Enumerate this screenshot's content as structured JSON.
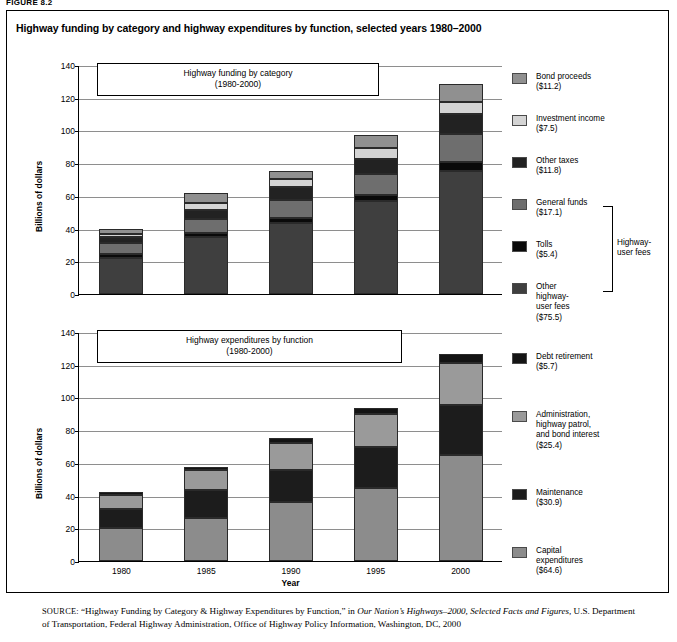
{
  "figure_label": "FIGURE 8.2",
  "title": "Highway funding by category and highway expenditures by function, selected years 1980–2000",
  "source": {
    "prefix": "SOURCE:",
    "quoted": "“Highway Funding by Category & Highway Expenditures by Function,” in ",
    "italic1": "Our Nation’s Highways–2000, Selected Facts and Figures,",
    "rest": " U.S. Department of Transportation, Federal Highway Administration, Office of Highway Policy Information, Washington, DC, 2000"
  },
  "chart_data": [
    {
      "type": "bar",
      "stacked": true,
      "title": "Highway funding by category",
      "subtitle": "(1980-2000)",
      "xlabel": "",
      "ylabel": "Billions of dollars",
      "ylim": [
        0,
        140
      ],
      "yticks": [
        0,
        20,
        40,
        60,
        80,
        100,
        120,
        140
      ],
      "grid": true,
      "legend_position": "right",
      "categories": [
        "1980",
        "1985",
        "1990",
        "1995",
        "2000"
      ],
      "xtick_labels_visible": false,
      "series": [
        {
          "name": "Other highway-user fees",
          "label": "Other\nhighway-\nuser fees\n($75.5)",
          "color": "#3f3f3f",
          "values": [
            22.3,
            34.6,
            43.5,
            56.6,
            75.5
          ]
        },
        {
          "name": "Tolls",
          "label": "Tolls\n($5.4)",
          "color": "#0a0a0a",
          "values": [
            2.0,
            2.6,
            3.2,
            4.1,
            5.4
          ]
        },
        {
          "name": "General funds",
          "label": "General funds\n($17.1)",
          "color": "#6e6e6e",
          "values": [
            6.6,
            8.9,
            11.0,
            12.5,
            17.1
          ]
        },
        {
          "name": "Other taxes",
          "label": "Other taxes\n($11.8)",
          "color": "#222222",
          "values": [
            4.0,
            5.3,
            7.6,
            9.4,
            11.8
          ]
        },
        {
          "name": "Investment income",
          "label": "Investment income\n($7.5)",
          "color": "#d4d4d4",
          "values": [
            1.6,
            4.1,
            5.2,
            6.4,
            7.5
          ]
        },
        {
          "name": "Bond proceeds",
          "label": "Bond proceeds\n($11.2)",
          "color": "#909090",
          "values": [
            3.2,
            6.0,
            5.0,
            8.0,
            11.2
          ]
        }
      ],
      "totals": [
        39.7,
        61.5,
        75.5,
        97.0,
        128.5
      ],
      "group_bracket_label": "Highway-\nuser fees",
      "group_bracket_members": [
        "Tolls",
        "Other highway-user fees"
      ]
    },
    {
      "type": "bar",
      "stacked": true,
      "title": "Highway expenditures by function",
      "subtitle": "(1980-2000)",
      "xlabel": "Year",
      "ylabel": "Billions of dollars",
      "ylim": [
        0,
        140
      ],
      "yticks": [
        0,
        20,
        40,
        60,
        80,
        100,
        120,
        140
      ],
      "grid": true,
      "legend_position": "right",
      "categories": [
        "1980",
        "1985",
        "1990",
        "1995",
        "2000"
      ],
      "xtick_labels_visible": true,
      "series": [
        {
          "name": "Capital expenditures",
          "label": "Capital\nexpenditures\n($64.6)",
          "color": "#8c8c8c",
          "values": [
            20.3,
            26.5,
            36.0,
            44.6,
            64.6
          ]
        },
        {
          "name": "Maintenance",
          "label": "Maintenance\n($30.9)",
          "color": "#1c1c1c",
          "values": [
            11.8,
            17.0,
            19.8,
            25.0,
            30.9
          ]
        },
        {
          "name": "Administration, highway patrol, and bond interest",
          "label": "Administration,\nhighway patrol,\nand bond interest\n($25.4)",
          "color": "#9a9a9a",
          "values": [
            8.5,
            12.2,
            16.4,
            20.3,
            25.4
          ]
        },
        {
          "name": "Debt retirement",
          "label": "Debt retirement\n($5.7)",
          "color": "#141414",
          "values": [
            1.4,
            1.8,
            3.0,
            3.6,
            5.7
          ]
        }
      ],
      "totals": [
        42.0,
        57.5,
        75.2,
        93.5,
        126.6
      ]
    }
  ],
  "axes": {
    "ytick_labels": [
      "0",
      "20",
      "40",
      "60",
      "80",
      "100",
      "120",
      "140"
    ],
    "xtick_labels": [
      "1980",
      "1985",
      "1990",
      "1995",
      "2000"
    ],
    "ylabel": "Billions of dollars",
    "xlabel": "Year"
  }
}
